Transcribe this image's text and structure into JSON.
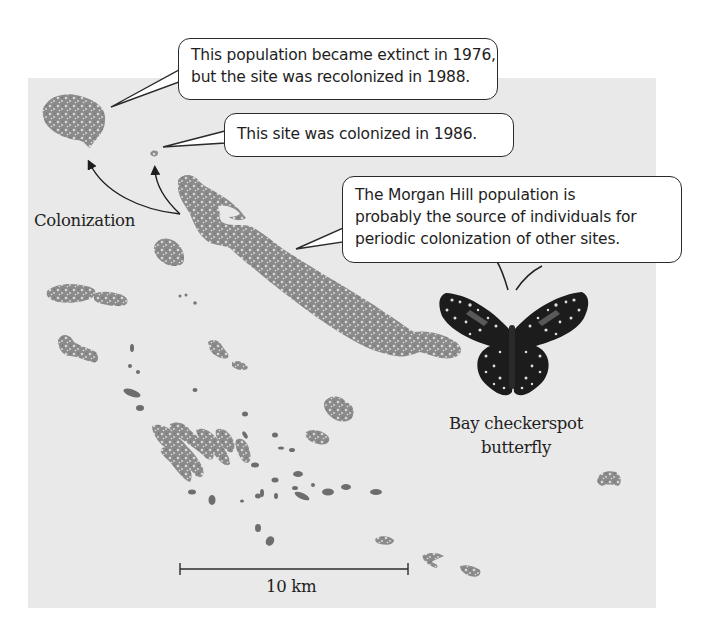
{
  "figure": {
    "callouts": {
      "extinct": {
        "lines": [
          "This population became extinct in 1976,",
          "but the site was recolonized in 1988."
        ]
      },
      "colonized": {
        "lines": [
          "This site was colonized in 1986."
        ]
      },
      "morgan_hill": {
        "lines": [
          "The Morgan Hill population is",
          "probably the source of individuals for",
          "periodic colonization of other sites."
        ]
      }
    },
    "labels": {
      "colonization": "Colonization",
      "butterfly_caption": [
        "Bay checkerspot",
        "butterfly"
      ]
    },
    "scale_bar": {
      "label": "10 km"
    },
    "colors": {
      "map_background": "#e9e9e9",
      "habitat_patch": "#8a8a8a",
      "solid_patch": "#6d6d6d",
      "outline": "#2b2b2b",
      "butterfly_body": "#1a1a1a"
    },
    "icons": {
      "butterfly": "bay-checkerspot-butterfly-illustration",
      "arrow": "colonization-arrow"
    }
  }
}
